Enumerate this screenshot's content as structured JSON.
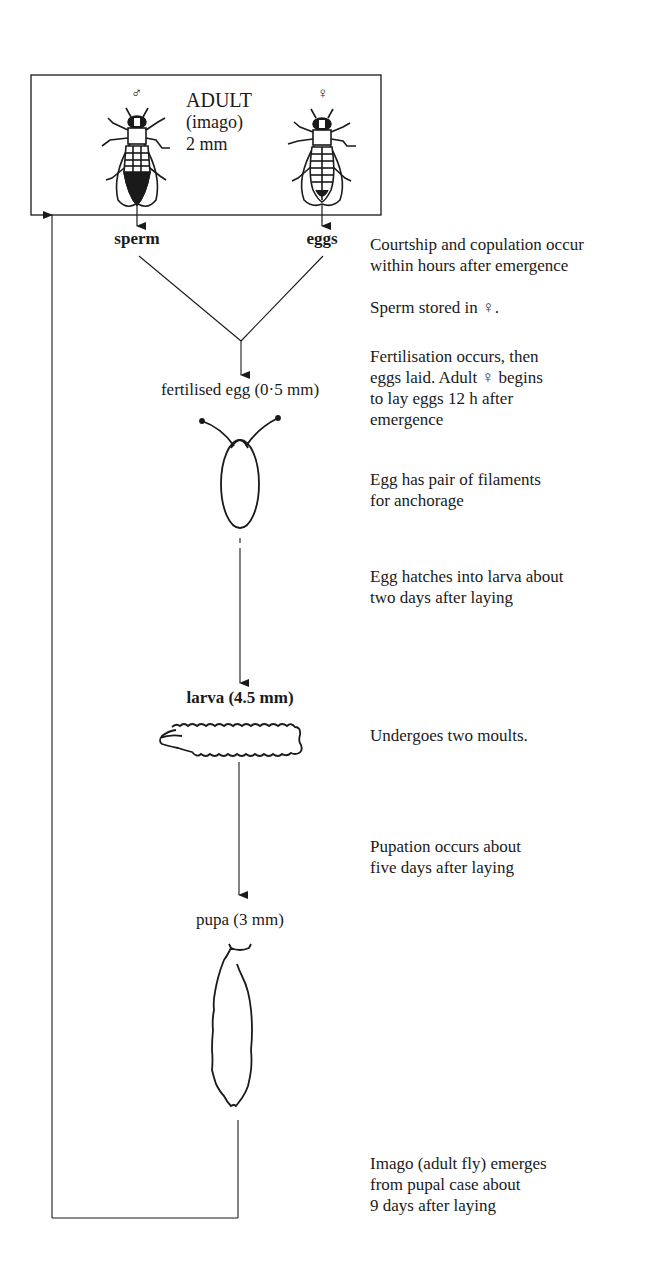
{
  "adult_box": {
    "male_symbol": "♂",
    "female_symbol": "♀",
    "title": "ADULT",
    "subtitle": "(imago)",
    "size": "2 mm"
  },
  "outputs": {
    "male": "sperm",
    "female": "eggs"
  },
  "stages": [
    {
      "id": "fertilised-egg",
      "label": "fertilised egg (0·5 mm)"
    },
    {
      "id": "larva",
      "label": "larva (4.5 mm)"
    },
    {
      "id": "pupa",
      "label": "pupa (3 mm)"
    }
  ],
  "notes": [
    {
      "lines": [
        "Courtship and copulation occur",
        "within hours after emergence"
      ]
    },
    {
      "lines": [
        "Sperm stored in  ♀."
      ]
    },
    {
      "lines": [
        "Fertilisation occurs, then",
        "eggs laid. Adult ♀ begins",
        "to lay eggs 12 h after",
        "emergence"
      ]
    },
    {
      "lines": [
        "Egg has pair of filaments",
        "for anchorage"
      ]
    },
    {
      "lines": [
        "Egg hatches into larva about",
        "two days after laying"
      ]
    },
    {
      "lines": [
        "Undergoes two moults."
      ]
    },
    {
      "lines": [
        "Pupation occurs about",
        "five days after laying"
      ]
    },
    {
      "lines": [
        "Imago (adult fly) emerges",
        "from pupal case about",
        "9 days after laying"
      ]
    }
  ],
  "colors": {
    "ink": "#1a1a1a",
    "background": "#ffffff"
  }
}
